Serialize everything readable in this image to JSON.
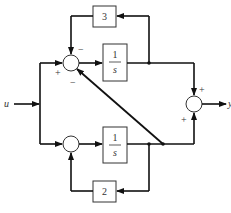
{
  "diagram": {
    "type": "block-diagram",
    "input_label": "u",
    "output_label": "y",
    "blocks": [
      {
        "id": "gain-top",
        "label": "3"
      },
      {
        "id": "integrator-top",
        "numerator": "1",
        "denominator": "s"
      },
      {
        "id": "integrator-bottom",
        "numerator": "1",
        "denominator": "s"
      },
      {
        "id": "gain-bottom",
        "label": "2"
      }
    ],
    "junctions": {
      "top": {
        "signs": {
          "left": "+",
          "top": "−",
          "bottom": "−"
        }
      },
      "bottom": {
        "signs": {}
      },
      "output": {
        "signs": {
          "top": "+",
          "bottom": "+"
        }
      }
    },
    "colors": {
      "line": "#111111",
      "box_fill": "#ffffff"
    }
  }
}
